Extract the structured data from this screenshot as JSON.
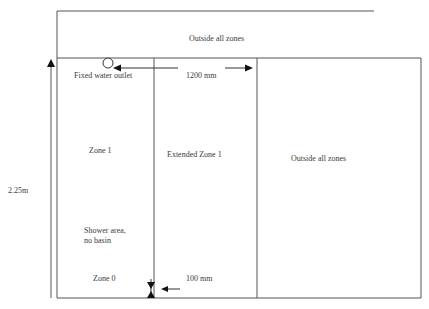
{
  "diagram": {
    "title_zone_top": "Outside all zones",
    "fixed_water_outlet": "Fixed water  outlet",
    "dimension_width": "1200 mm",
    "zone1": "Zone 1",
    "extended_zone1": "Extended Zone 1",
    "outside_right": "Outside all zones",
    "height_label": "2.25m",
    "shower_area_line1": "Shower area,",
    "shower_area_line2": "no  basin",
    "zone0": "Zone 0",
    "dimension_gap": "100 mm"
  },
  "colors": {
    "line": "#555555",
    "arrow": "#111111",
    "text": "#3a3a3a"
  }
}
